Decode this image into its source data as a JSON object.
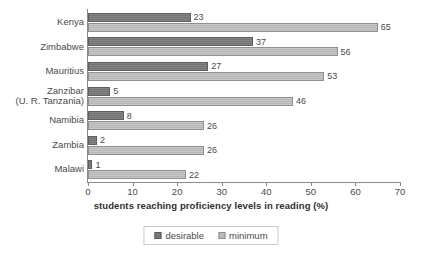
{
  "chart_data": {
    "type": "bar",
    "orientation": "horizontal",
    "title": "",
    "xlabel": "students reaching proficiency levels in reading (%)",
    "ylabel": "",
    "xlim": [
      0,
      70
    ],
    "xticks": [
      "0",
      "10",
      "20",
      "30",
      "40",
      "50",
      "60",
      "70"
    ],
    "grid": false,
    "legend_position": "bottom-center",
    "categories": [
      "Kenya",
      "Zimbabwe",
      "Mauritius",
      "Zanzibar\n(U. R. Tanzania)",
      "Namibia",
      "Zambia",
      "Malawi"
    ],
    "category_lines": [
      [
        "Kenya"
      ],
      [
        "Zimbabwe"
      ],
      [
        "Mauritius"
      ],
      [
        "Zanzibar",
        "(U. R. Tanzania)"
      ],
      [
        "Namibia"
      ],
      [
        "Zambia"
      ],
      [
        "Malawi"
      ]
    ],
    "series": [
      {
        "name": "desirable",
        "color": "#7a7a7a",
        "values": [
          23,
          37,
          27,
          5,
          8,
          2,
          1
        ]
      },
      {
        "name": "minimum",
        "color": "#bcbcbc",
        "values": [
          65,
          56,
          53,
          46,
          26,
          26,
          22
        ]
      }
    ]
  },
  "legend": {
    "items": [
      {
        "label": "desirable"
      },
      {
        "label": "minimum"
      }
    ]
  }
}
